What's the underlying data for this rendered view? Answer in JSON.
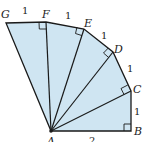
{
  "diagram": {
    "fill_color": "#cfe5f2",
    "stroke_color": "#1a1a1a",
    "vertices": {
      "A": {
        "label": "A",
        "x": 51,
        "y": 131
      },
      "B": {
        "label": "B",
        "x": 131,
        "y": 131
      },
      "C": {
        "label": "C",
        "x": 131,
        "y": 91
      },
      "D": {
        "label": "D",
        "x": 113,
        "y": 52
      },
      "E": {
        "label": "E",
        "x": 84,
        "y": 29
      },
      "F": {
        "label": "F",
        "x": 46,
        "y": 22
      },
      "G": {
        "label": "G",
        "x": 6,
        "y": 23
      }
    },
    "edge_labels": {
      "AB": "2",
      "BC": "1",
      "CD": "1",
      "DE": "1",
      "EF": "1",
      "FG": "1"
    }
  }
}
